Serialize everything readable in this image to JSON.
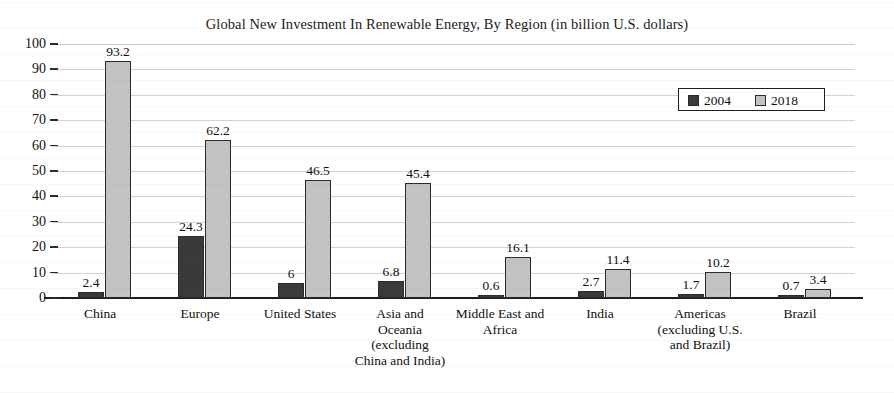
{
  "chart_data": {
    "type": "bar",
    "title": "Global New Investment In Renewable Energy, By Region (in billion U.S. dollars)",
    "xlabel": "",
    "ylabel": "",
    "ylim": [
      0,
      100
    ],
    "ytick_step": 10,
    "grid": true,
    "legend_position": "top-right",
    "categories": [
      "China",
      "Europe",
      "United States",
      "Asia and Oceania (excluding China and India)",
      "Middle East and Africa",
      "India",
      "Americas (excluding U.S. and Brazil)",
      "Brazil"
    ],
    "category_lines": [
      [
        "China"
      ],
      [
        "Europe"
      ],
      [
        "United States"
      ],
      [
        "Asia and",
        "Oceania",
        "(excluding",
        "China and India)"
      ],
      [
        "Middle East and",
        "Africa"
      ],
      [
        "India"
      ],
      [
        "Americas",
        "(excluding U.S.",
        "and Brazil)"
      ],
      [
        "Brazil"
      ]
    ],
    "yticks": [
      "0",
      "10",
      "20",
      "30",
      "40",
      "50",
      "60",
      "70",
      "80",
      "90",
      "100"
    ],
    "series": [
      {
        "name": "2004",
        "color": "#3a3a3a",
        "values": [
          2.4,
          24.3,
          6,
          6.8,
          0.6,
          2.7,
          1.7,
          0.7
        ],
        "labels": [
          "2.4",
          "24.3",
          "6",
          "6.8",
          "0.6",
          "2.7",
          "1.7",
          "0.7"
        ]
      },
      {
        "name": "2018",
        "color": "#c2c2c2",
        "values": [
          93.2,
          62.2,
          46.5,
          45.4,
          16.1,
          11.4,
          10.2,
          3.4
        ],
        "labels": [
          "93.2",
          "62.2",
          "46.5",
          "45.4",
          "16.1",
          "11.4",
          "10.2",
          "3.4"
        ]
      }
    ]
  },
  "colors": {
    "series_2004": "#3a3a3a",
    "series_2018": "#c2c2c2",
    "axis": "#1e1e1e",
    "grid": "#d2d2d2",
    "background": "#ffffff",
    "text": "#101010"
  }
}
